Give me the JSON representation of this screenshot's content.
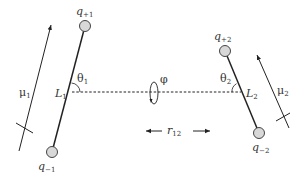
{
  "diagram": {
    "colors": {
      "line": "#222222",
      "charge_fill": "#d8d8d8",
      "charge_stroke": "#444444",
      "text": "#333333"
    },
    "dipole1": {
      "charge_plus": {
        "symbol": "q",
        "subscript": "+1"
      },
      "charge_minus": {
        "symbol": "q",
        "subscript": "−1"
      },
      "length_label": {
        "symbol": "L",
        "subscript": "1"
      },
      "angle_label": {
        "symbol": "θ",
        "subscript": "1"
      },
      "moment_label": {
        "symbol": "μ",
        "subscript": "1"
      }
    },
    "dipole2": {
      "charge_plus": {
        "symbol": "q",
        "subscript": "+2"
      },
      "charge_minus": {
        "symbol": "q",
        "subscript": "−2"
      },
      "length_label": {
        "symbol": "L",
        "subscript": "2"
      },
      "angle_label": {
        "symbol": "θ",
        "subscript": "2"
      },
      "moment_label": {
        "symbol": "μ",
        "subscript": "2"
      }
    },
    "torsion_label": "φ",
    "separation_label": {
      "symbol": "r",
      "subscript": "12"
    }
  }
}
